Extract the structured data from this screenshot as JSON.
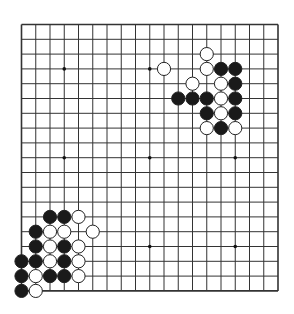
{
  "board": {
    "size": 19,
    "origin": {
      "x": 21.5,
      "y": 24.5
    },
    "spacing": {
      "x": 14.25,
      "y": 14.8
    },
    "line_color": "#333333",
    "background": "#ffffff",
    "star_points": [
      [
        3,
        3
      ],
      [
        9,
        3
      ],
      [
        15,
        3
      ],
      [
        3,
        9
      ],
      [
        9,
        9
      ],
      [
        15,
        9
      ],
      [
        3,
        15
      ],
      [
        9,
        15
      ],
      [
        15,
        15
      ]
    ],
    "stone_radius": 6.6
  },
  "stones": {
    "black": [
      [
        14,
        3
      ],
      [
        15,
        3
      ],
      [
        15,
        4
      ],
      [
        11,
        5
      ],
      [
        12,
        5
      ],
      [
        13,
        5
      ],
      [
        15,
        5
      ],
      [
        13,
        6
      ],
      [
        15,
        6
      ],
      [
        14,
        7
      ],
      [
        2,
        13
      ],
      [
        3,
        13
      ],
      [
        1,
        14
      ],
      [
        1,
        15
      ],
      [
        3,
        15
      ],
      [
        0,
        16
      ],
      [
        1,
        16
      ],
      [
        3,
        16
      ],
      [
        0,
        17
      ],
      [
        2,
        17
      ],
      [
        3,
        17
      ],
      [
        0,
        18
      ]
    ],
    "white": [
      [
        13,
        2
      ],
      [
        10,
        3
      ],
      [
        13,
        3
      ],
      [
        12,
        4
      ],
      [
        14,
        4
      ],
      [
        14,
        5
      ],
      [
        14,
        6
      ],
      [
        13,
        7
      ],
      [
        15,
        7
      ],
      [
        4,
        13
      ],
      [
        2,
        14
      ],
      [
        3,
        14
      ],
      [
        5,
        14
      ],
      [
        2,
        15
      ],
      [
        4,
        15
      ],
      [
        2,
        16
      ],
      [
        4,
        16
      ],
      [
        1,
        17
      ],
      [
        4,
        17
      ],
      [
        1,
        18
      ]
    ]
  },
  "colors": {
    "black_stone": "#1a1a1a",
    "white_stone": "#ffffff",
    "stone_outline": "#222222"
  }
}
